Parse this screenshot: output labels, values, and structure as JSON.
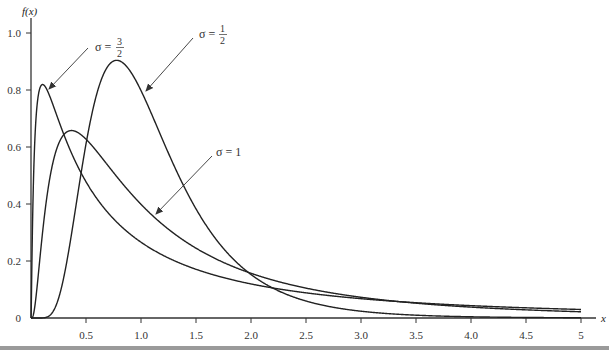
{
  "chart_data": {
    "type": "line",
    "title": "",
    "xlabel": "x",
    "ylabel": "f(x)",
    "xlim": [
      0,
      5
    ],
    "ylim": [
      0,
      1.05
    ],
    "grid": false,
    "legend": "none (curves annotated with arrows)",
    "x_ticks": [
      0.5,
      1.0,
      1.5,
      2.0,
      2.5,
      3.0,
      3.5,
      4.0,
      4.5,
      5
    ],
    "x_tick_labels": [
      "0.5",
      "1.0",
      "1.5",
      "2.0",
      "2.5",
      "3.0",
      "3.5",
      "4.0",
      "4.5",
      "5"
    ],
    "y_ticks": [
      0,
      0.2,
      0.4,
      0.6,
      0.8,
      1.0
    ],
    "y_tick_labels": [
      "0",
      "0.2",
      "0.4",
      "0.6",
      "0.8",
      "1.0"
    ],
    "x": [
      0.05,
      0.1,
      0.2,
      0.3,
      0.368,
      0.5,
      0.779,
      1.0,
      1.5,
      2.0,
      2.5,
      3.0,
      3.5,
      4.0,
      4.5,
      5.0
    ],
    "series": [
      {
        "name": "σ = 1/2",
        "sigma": 0.5,
        "mu": 0,
        "peak": {
          "x": 0.78,
          "y": 0.9
        },
        "values": [
          0.0,
          0.0,
          0.0,
          0.04,
          0.13,
          0.6,
          0.9,
          0.8,
          0.39,
          0.15,
          0.058,
          0.023,
          0.0096,
          0.0042,
          0.0019,
          0.0009
        ]
      },
      {
        "name": "σ = 1",
        "sigma": 1.0,
        "mu": 0,
        "peak": {
          "x": 0.37,
          "y": 0.66
        },
        "values": [
          0.11,
          0.28,
          0.55,
          0.64,
          0.66,
          0.63,
          0.54,
          0.4,
          0.25,
          0.16,
          0.1,
          0.073,
          0.052,
          0.038,
          0.029,
          0.022
        ]
      },
      {
        "name": "σ = 3/2",
        "sigma": 1.5,
        "mu": 0,
        "peak": {
          "x": 0.105,
          "y": 0.81
        },
        "values": [
          0.7,
          0.81,
          0.75,
          0.62,
          0.56,
          0.48,
          0.35,
          0.27,
          0.17,
          0.12,
          0.088,
          0.068,
          0.054,
          0.044,
          0.036,
          0.03
        ]
      }
    ],
    "annotations": [
      {
        "text": "σ = 3/2",
        "points_to": "σ = 3/2 curve near peak"
      },
      {
        "text": "σ = 1/2",
        "points_to": "σ = 1/2 curve right of peak"
      },
      {
        "text": "σ = 1",
        "points_to": "σ = 1 curve descending side"
      }
    ]
  },
  "labels": {
    "ylabel": "f(x)",
    "xlabel": "x",
    "ann_sigma_32_sym": "σ =",
    "ann_sigma_32_num": "3",
    "ann_sigma_32_den": "2",
    "ann_sigma_12_sym": "σ =",
    "ann_sigma_12_num": "1",
    "ann_sigma_12_den": "2",
    "ann_sigma_1": "σ = 1"
  }
}
